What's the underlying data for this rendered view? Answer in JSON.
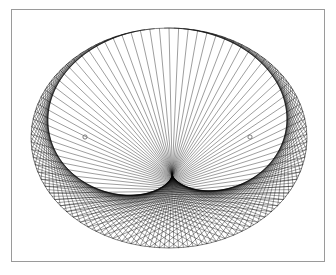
{
  "figure": {
    "title": "Elliptical chord envelope (string-art caustic)",
    "type": "geometric-envelope",
    "background_color": "#ffffff",
    "line_color": "#000000",
    "marker_color": "#6d6d6d"
  },
  "frame": {
    "name": "plot-frame",
    "x": 11,
    "y": 9,
    "width": 314,
    "height": 253,
    "border_color": "#9a9a9a",
    "border_width": 1,
    "fill": "#ffffff"
  },
  "outer_ellipse": {
    "center_x": 169,
    "center_y": 138,
    "radius_x": 138,
    "radius_y": 110,
    "stroke": "#000000",
    "stroke_width": 0.5
  },
  "inner_envelope": {
    "center_x": 169,
    "center_y": 138,
    "radius_x": 103,
    "radius_y": 50,
    "note": "white region bounded by the caustic of the chord family"
  },
  "chords": {
    "count": 180,
    "step": 47,
    "stroke": "#000000",
    "stroke_width": 0.45,
    "stroke_opacity": 0.85
  },
  "focus_markers": [
    {
      "label": "focus-left",
      "cx": 85,
      "cy": 137,
      "r": 2.1
    },
    {
      "label": "focus-right",
      "cx": 250,
      "cy": 137,
      "r": 2.1
    }
  ],
  "chart_data": {
    "type": "scatter",
    "title": "Elliptical chord envelope (string-art caustic)",
    "xlabel": "",
    "ylabel": "",
    "grid": false,
    "legend": null,
    "xlim": [
      31,
      307
    ],
    "ylim": [
      28,
      248
    ],
    "annotations": [
      {
        "text": "focus marker",
        "x": 85,
        "y": 137
      },
      {
        "text": "focus marker",
        "x": 250,
        "y": 137
      }
    ],
    "series": [
      {
        "name": "outer ellipse node points",
        "n_points": 180,
        "parametric": "x = 169 + 138*cos(t), y = 138 + 110*sin(t), t = 2*pi*k/180"
      },
      {
        "name": "chords",
        "n_lines": 180,
        "rule": "connect node k to node (k*2 + 47) mod 180"
      }
    ]
  }
}
